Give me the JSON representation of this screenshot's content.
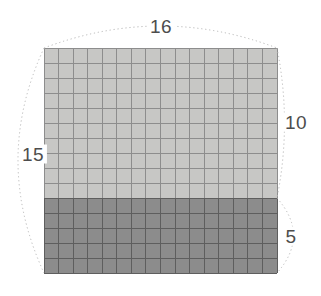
{
  "diagram": {
    "labels": {
      "top": "16",
      "left": "15",
      "right_upper": "10",
      "right_lower": "5"
    },
    "grid": {
      "columns": 16,
      "total_rows": 15,
      "upper_rows": 10,
      "lower_rows": 5
    },
    "colors": {
      "upper_fill": "#c7c7c5",
      "upper_line": "#8d8d8d",
      "lower_fill": "#8c8c8c",
      "lower_line": "#5e5e5e",
      "curve": "#b8b8b8",
      "label_text": "#4d4d4d",
      "background": "#ffffff"
    }
  }
}
